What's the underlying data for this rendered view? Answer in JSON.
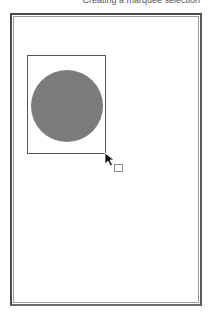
{
  "caption": {
    "text": "Creating a marquee selection"
  },
  "canvas": {
    "frame_color": "#4a4a4a",
    "inner_line_color": "#9a9a9a",
    "background": "#ffffff"
  },
  "selection": {
    "type": "marquee",
    "border_color": "#555555"
  },
  "shape": {
    "type": "circle",
    "fill": "#7b7b7b"
  },
  "cursor": {
    "icon": "arrow-cursor-icon",
    "modifier_icon": "marquee-square-icon"
  }
}
